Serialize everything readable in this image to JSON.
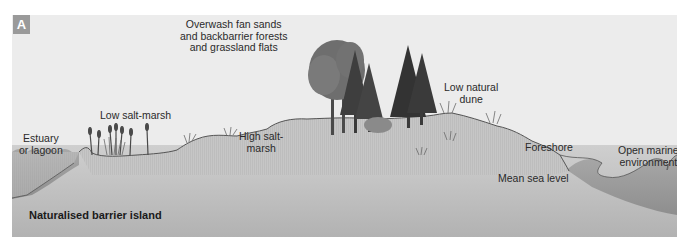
{
  "figure": {
    "panel_label": "A",
    "title": "Naturalised barrier island",
    "labels": {
      "overwash": [
        "Overwash fan sands",
        "and backbarrier forests",
        "and grassland flats"
      ],
      "estuary": [
        "Estuary",
        "or lagoon"
      ],
      "low_salt_marsh": [
        "Low salt-marsh"
      ],
      "high_salt_marsh": [
        "High salt-",
        "marsh"
      ],
      "low_natural_dune": [
        "Low natural",
        "dune"
      ],
      "foreshore": [
        "Foreshore"
      ],
      "open_marine": [
        "Open marine",
        "environment"
      ],
      "mean_sea_level": [
        "Mean sea level"
      ]
    },
    "colors": {
      "sky": "#ececec",
      "ground_upper": "#c8c8c8",
      "ground_lower": "#b4b4b4",
      "water": "#a0a0a0",
      "badge": "#9a9a9a",
      "trees": "#3c3c3c"
    }
  }
}
